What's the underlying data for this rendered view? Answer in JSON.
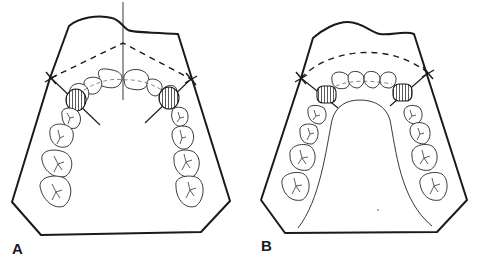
{
  "figure": {
    "panels": [
      {
        "id": "A",
        "label": "A",
        "arch": "maxillary",
        "features": [
          "midline",
          "dashed-reference-lines-to-midline",
          "cross-markers",
          "hatched-premolars",
          "radiating-lines"
        ]
      },
      {
        "id": "B",
        "label": "B",
        "arch": "mandibular",
        "features": [
          "dashed-arc",
          "cross-markers",
          "hatched-premolars",
          "tongue-space-outline"
        ]
      }
    ],
    "colors": {
      "ink": "#1a1a1a",
      "background": "#ffffff"
    }
  }
}
